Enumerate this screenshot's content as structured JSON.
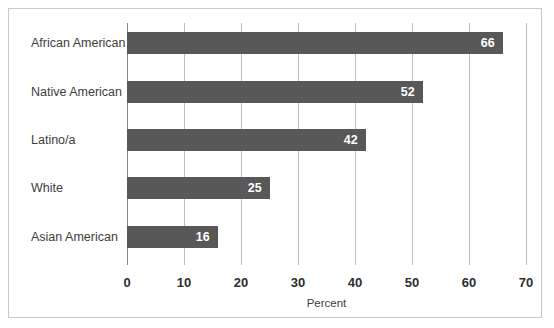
{
  "chart_data": {
    "type": "bar",
    "orientation": "horizontal",
    "title": "",
    "xlabel": "Percent",
    "ylabel": "",
    "categories": [
      "African American",
      "Native American",
      "Latino/a",
      "White",
      "Asian American"
    ],
    "values": [
      66,
      52,
      42,
      25,
      16
    ],
    "value_labels": [
      "66",
      "52",
      "42",
      "25",
      "16"
    ],
    "xlim": [
      0,
      70
    ],
    "xticks": [
      0,
      10,
      20,
      30,
      40,
      50,
      60,
      70
    ],
    "xtick_labels": [
      "0",
      "10",
      "20",
      "30",
      "40",
      "50",
      "60",
      "70"
    ],
    "grid": "vertical",
    "legend": "none",
    "colors": {
      "bar": "#585858",
      "gridline": "#bdbdbd",
      "axis": "#8a8a8a",
      "border": "#c9c9c9",
      "value_label_text": "#ffffff",
      "category_label_text": "#3d3d3d",
      "tick_label_text": "#2e2e2e"
    }
  }
}
